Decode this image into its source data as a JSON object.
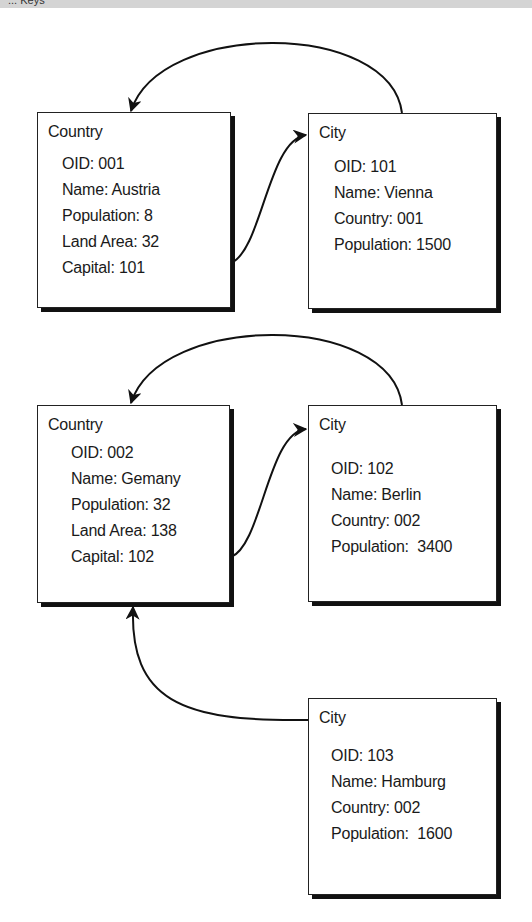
{
  "header": {
    "title": "... Keys"
  },
  "diagram": {
    "boxes": [
      {
        "id": "country-001",
        "title": "Country",
        "fields": [
          "OID: 001",
          "Name: Austria",
          "Population: 8",
          "Land Area: 32",
          "Capital: 101"
        ]
      },
      {
        "id": "city-101",
        "title": "City",
        "fields": [
          "OID: 101",
          "Name: Vienna",
          "Country: 001",
          "Population: 1500"
        ]
      },
      {
        "id": "country-002",
        "title": "Country",
        "fields": [
          "OID: 002",
          "Name: Gemany",
          "Population: 32",
          "Land Area: 138",
          "Capital: 102"
        ]
      },
      {
        "id": "city-102",
        "title": "City",
        "fields": [
          "OID: 102",
          "Name: Berlin",
          "Country: 002",
          "Population:  3400"
        ]
      },
      {
        "id": "city-103",
        "title": "City",
        "fields": [
          "OID: 103",
          "Name: Hamburg",
          "Country: 002",
          "Population:  1600"
        ]
      }
    ],
    "links": [
      {
        "from": "country-001",
        "to": "city-101",
        "label": "Capital"
      },
      {
        "from": "city-101",
        "to": "country-001",
        "label": "Country"
      },
      {
        "from": "country-002",
        "to": "city-102",
        "label": "Capital"
      },
      {
        "from": "city-102",
        "to": "country-002",
        "label": "Country"
      },
      {
        "from": "city-103",
        "to": "country-002",
        "label": "Country"
      }
    ]
  }
}
